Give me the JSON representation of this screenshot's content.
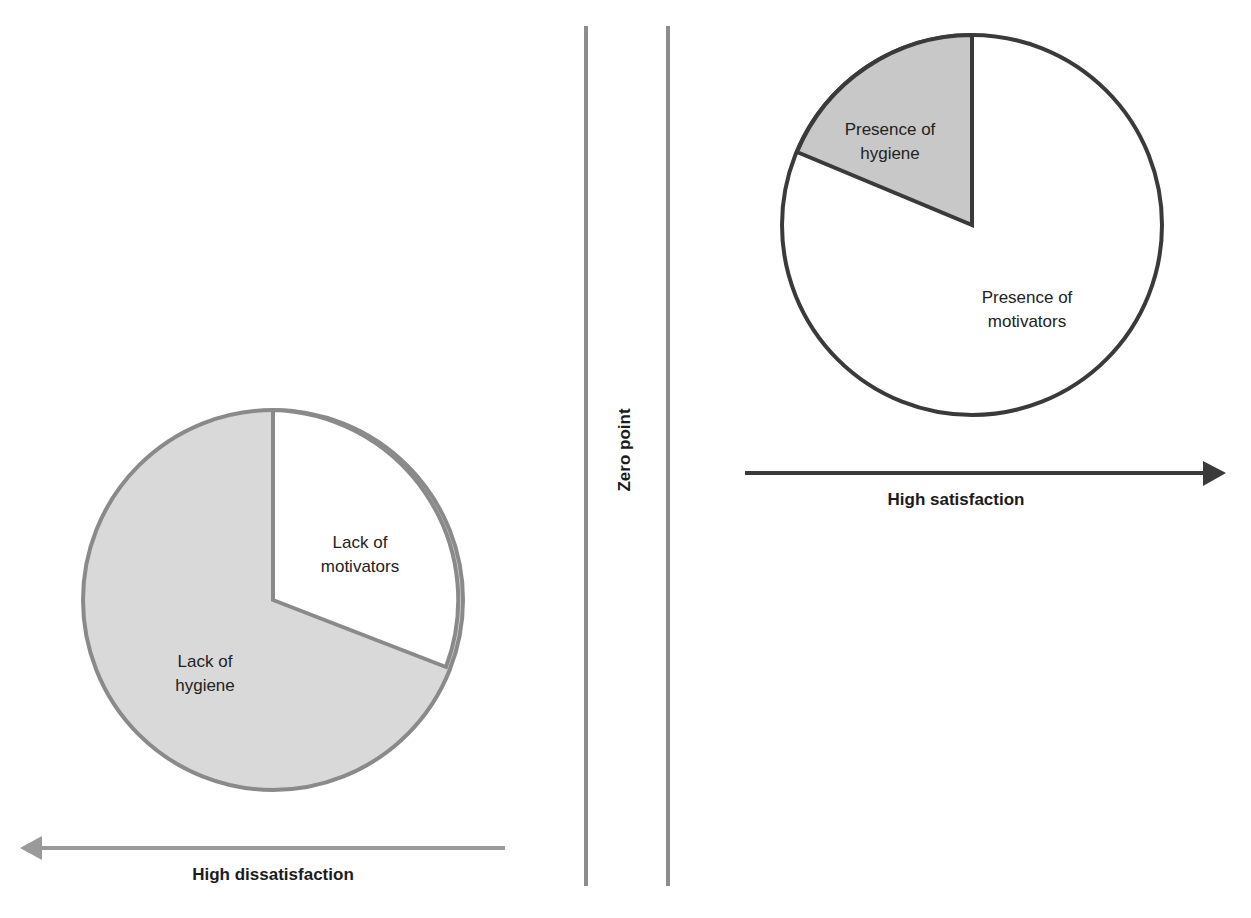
{
  "diagram": {
    "zero_point_label": "Zero point",
    "left": {
      "axis_label": "High dissatisfaction",
      "arrow_direction": "left",
      "pie": {
        "slices": [
          {
            "label_line1": "Lack of",
            "label_line2": "motivators",
            "fill": "#ffffff",
            "share_pct": 31
          },
          {
            "label_line1": "Lack of",
            "label_line2": "hygiene",
            "fill": "#d9d9d9",
            "share_pct": 69
          }
        ],
        "border_color": "#8a8a8a"
      },
      "arrow_color": "#9a9a9a"
    },
    "right": {
      "axis_label": "High satisfaction",
      "arrow_direction": "right",
      "pie": {
        "slices": [
          {
            "label_line1": "Presence of",
            "label_line2": "hygiene",
            "fill": "#c8c8c8",
            "share_pct": 19
          },
          {
            "label_line1": "Presence of",
            "label_line2": "motivators",
            "fill": "#ffffff",
            "share_pct": 81
          }
        ],
        "border_color": "#3a3a3a"
      },
      "arrow_color": "#3a3a3a"
    },
    "divider_color": "#8c8c8c"
  }
}
